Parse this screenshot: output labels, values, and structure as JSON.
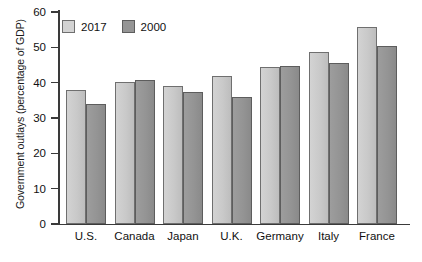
{
  "chart_data": {
    "type": "bar",
    "title": "",
    "xlabel": "",
    "ylabel": "Government outlays (percentage of GDP)",
    "ylim": [
      0,
      60
    ],
    "yticks": [
      0,
      10,
      20,
      30,
      40,
      50,
      60
    ],
    "grid": false,
    "legend_position": "top-left",
    "categories": [
      "U.S.",
      "Canada",
      "Japan",
      "U.K.",
      "Germany",
      "Italy",
      "France"
    ],
    "series": [
      {
        "name": "2017",
        "color": "#d3d3d3",
        "values": [
          38.0,
          40.3,
          39.0,
          42.0,
          44.5,
          48.8,
          55.8
        ]
      },
      {
        "name": "2000",
        "color": "#959595",
        "values": [
          34.0,
          40.7,
          37.5,
          36.0,
          44.7,
          45.5,
          50.5
        ]
      }
    ]
  },
  "legend": {
    "entries": [
      {
        "label": "2017"
      },
      {
        "label": "2000"
      }
    ]
  },
  "footer": {
    "note": ""
  }
}
